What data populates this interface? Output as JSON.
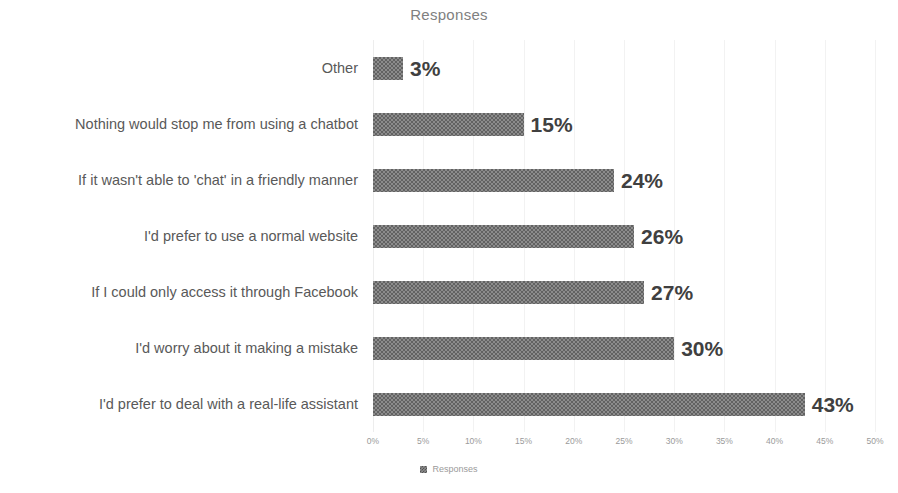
{
  "chart_data": {
    "type": "bar",
    "orientation": "horizontal",
    "title": "Responses",
    "xlabel": "",
    "ylabel": "",
    "xlim": [
      0,
      50
    ],
    "grid": true,
    "legend_position": "bottom",
    "legend": [
      "Responses"
    ],
    "xticks": [
      "0%",
      "5%",
      "10%",
      "15%",
      "20%",
      "25%",
      "30%",
      "35%",
      "40%",
      "45%",
      "50%"
    ],
    "xtick_values": [
      0,
      5,
      10,
      15,
      20,
      25,
      30,
      35,
      40,
      45,
      50
    ],
    "categories": [
      "Other",
      "Nothing would stop me from using a chatbot",
      "If it wasn't able to 'chat' in a friendly manner",
      "I'd prefer to use a normal website",
      "If I could only access it through Facebook",
      "I'd worry about it making a mistake",
      "I'd prefer to deal with a real-life assistant"
    ],
    "values": [
      3,
      15,
      24,
      26,
      27,
      30,
      43
    ],
    "value_labels": [
      "3%",
      "15%",
      "24%",
      "26%",
      "27%",
      "30%",
      "43%"
    ],
    "series": [
      {
        "name": "Responses",
        "values": [
          3,
          15,
          24,
          26,
          27,
          30,
          43
        ]
      }
    ],
    "colors": {
      "bar_fill": "#8c8c8c",
      "bar_pattern": "checkered-dither",
      "gridline": "#f2f2f2",
      "title_text": "#808080",
      "category_text": "#595959",
      "value_label_text": "#404040",
      "tick_text": "#9a9a9a",
      "background": "#ffffff"
    }
  }
}
